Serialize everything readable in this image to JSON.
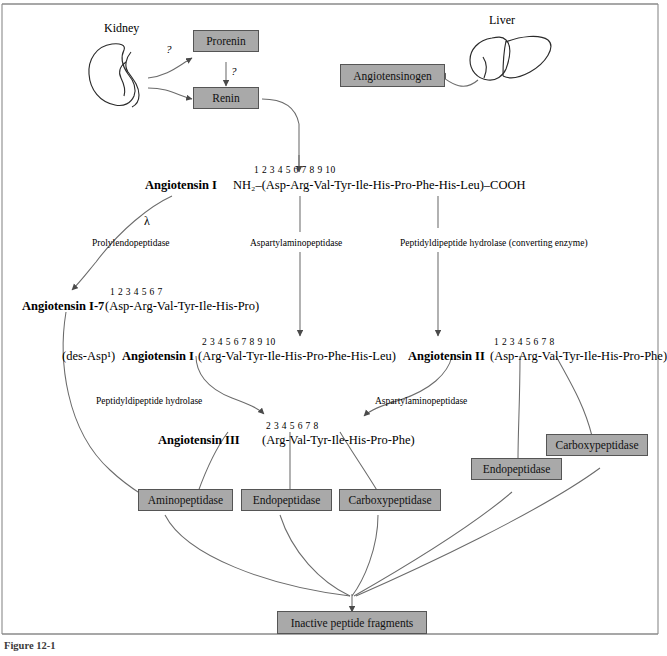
{
  "figure": {
    "frame_color": "#8a8a8a",
    "box_fill": "#a9a9a9",
    "box_border": "#555555",
    "line_color": "#6b6b6b",
    "caption": "Figure 12-1"
  },
  "organs": {
    "kidney_label": "Kidney",
    "liver_label": "Liver"
  },
  "boxes": {
    "prorenin": "Prorenin",
    "renin": "Renin",
    "angiotensinogen": "Angiotensinogen",
    "aminopeptidase": "Aminopeptidase",
    "endopeptidase_center": "Endopeptidase",
    "carboxypeptidase_center": "Carboxypeptidase",
    "endopeptidase_right": "Endopeptidase",
    "carboxypeptidase_right": "Carboxypeptidase",
    "inactive": "Inactive peptide fragments"
  },
  "markers": {
    "q1": "?",
    "q2": "?",
    "lambda": "λ"
  },
  "peptides": {
    "angiotensin_I": {
      "name": "Angiotensin I",
      "numbers": "1    2    3    4    5    6    7    8    9   10",
      "sequence": "NH₂–(Asp-Arg-Val-Tyr-Ile-His-Pro-Phe-His-Leu)–COOH"
    },
    "angiotensin_I7": {
      "name": "Angiotensin I-7",
      "numbers": "1     2     3    4     5    6     7",
      "sequence": "(Asp-Arg-Val-Tyr-Ile-His-Pro)"
    },
    "des_asp_angiotensin_I": {
      "prefix": "(des-Asp¹)",
      "name": "Angiotensin I",
      "numbers": "2    3    4    5    6    7    8    9   10",
      "sequence": "(Arg-Val-Tyr-Ile-His-Pro-Phe-His-Leu)"
    },
    "angiotensin_II": {
      "name": "Angiotensin II",
      "numbers": "1    2    3    4    5   6    7    8",
      "sequence": "(Asp-Arg-Val-Tyr-Ile-His-Pro-Phe)"
    },
    "angiotensin_III": {
      "name": "Angiotensin III",
      "numbers": "2    3    4    5    6    7    8",
      "sequence": "(Arg-Val-Tyr-Ile-His-Pro-Phe)"
    }
  },
  "enzymes": {
    "prolylendopeptidase": "Prolylendopeptidase",
    "aspartylaminopeptidase_top": "Aspartylaminopeptidase",
    "peptidyldipeptide_hydrolase_converting": "Peptidyldipeptide hydrolase (converting enzyme)",
    "peptidyldipeptide_hydrolase": "Peptidyldipeptide hydrolase",
    "aspartylaminopeptidase_mid": "Aspartylaminopeptidase"
  }
}
